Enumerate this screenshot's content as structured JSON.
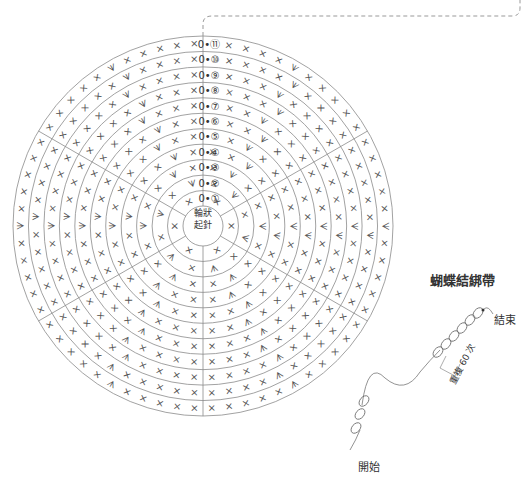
{
  "diagram": {
    "type": "crochet-chart",
    "round_marker_prefix": "0•",
    "round_labels": [
      "①",
      "②",
      "③",
      "④",
      "⑤",
      "⑥",
      "⑦",
      "⑧",
      "⑨",
      "⑩",
      "⑪"
    ],
    "center_label_line1": "輪狀",
    "center_label_line2": "起針",
    "stitch_symbols": {
      "single_crochet": "×",
      "increase": "☆V"
    },
    "spokes": 6
  },
  "tie": {
    "title": "蝴蝶結綁帶",
    "end_label": "結束",
    "start_label": "開始",
    "repeat_label": "重複 60 次"
  },
  "colors": {
    "line": "#8a8a8a",
    "text": "#333333"
  }
}
